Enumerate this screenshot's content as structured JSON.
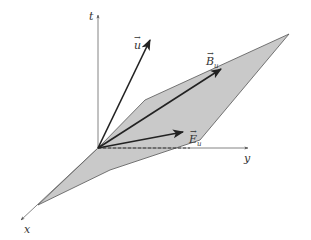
{
  "figure": {
    "type": "3d-vector-diagram",
    "colors": {
      "plane_fill": "#c9c9c9",
      "plane_edge": "#555555",
      "axis": "#666666",
      "vector": "#222222",
      "background": "#ffffff"
    },
    "axes": {
      "t": "t",
      "y": "y",
      "x": "x"
    },
    "vectors": {
      "u": {
        "symbol": "u",
        "arrow": "→"
      },
      "B": {
        "symbol": "B",
        "subscript": "u",
        "arrow": "→"
      },
      "E": {
        "symbol": "E",
        "subscript": "u",
        "arrow": "→"
      }
    }
  }
}
